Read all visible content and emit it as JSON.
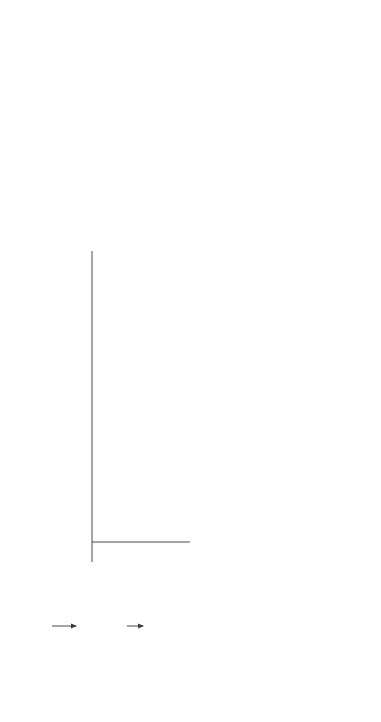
{
  "diagram": {
    "type": "flowchart",
    "orientation": "rotated-90-counterclockwise",
    "nodes": {
      "need": {
        "lines": [
          "Need"
        ]
      },
      "system_operational": {
        "lines": [
          "System operational",
          "requirements and",
          "maintenance concept",
          "(quality function deployment)"
        ]
      },
      "functional_analysis": {
        "sections": [
          {
            "lines": [
              "Functional analysis"
            ]
          },
          {
            "lines": [
              "Functional flow",
              "block diagrams"
            ]
          },
          {
            "lines": [
              "Allocation of system",
              "requirements"
            ]
          },
          {
            "lines": [
              "Preliminary",
              "analysis"
            ]
          }
        ]
      },
      "fmeca": {
        "lines": [
          "Failure mode,",
          "effects, and",
          "criticality",
          "analysis"
        ]
      },
      "maintainability": {
        "sections": [
          {
            "lines": [
              "Maintainability",
              "analysis"
            ]
          },
          {
            "lines": [
              "Level of repair"
            ]
          },
          {
            "lines": [
              "Maintainability",
              "prediction"
            ]
          }
        ]
      },
      "rcm": {
        "lines": [
          "Reliability-",
          "centered",
          "maintenance"
        ]
      },
      "maintenance_task": {
        "lines": [
          "Maintenance",
          "task",
          "analysis"
        ]
      },
      "life_cycle_cost": {
        "lines": [
          "Life-cycle",
          "cost analysis"
        ]
      },
      "decision": {
        "lines": [
          "Have the",
          "system",
          "requirements",
          "been met?"
        ]
      },
      "design_review": {
        "lines": [
          "Design review",
          "and evaluation"
        ]
      },
      "detailed_maintenance_plan": {
        "lines": [
          "Detailed",
          "maintenance",
          "plan"
        ]
      },
      "system_test": {
        "lines": [
          "System test",
          "and",
          "evaluation"
        ]
      },
      "reliability_prediction": {
        "lines": [
          "Reliability",
          "prediction"
        ]
      },
      "system_reliability": {
        "lines": [
          "System reliability",
          "analysis, modeling,",
          "and allocation"
        ]
      },
      "system_redesign": {
        "lines": [
          "System redesign"
        ]
      }
    },
    "edge_labels": {
      "yes": "Yes",
      "no": "No",
      "continuation_symbol": "~"
    },
    "edges": [
      [
        "need",
        "system_operational"
      ],
      [
        "system_operational",
        "functional_analysis"
      ],
      [
        "system_operational",
        "fmeca"
      ],
      [
        "system_operational",
        "maintainability"
      ],
      [
        "system_operational",
        "maintenance_task"
      ],
      [
        "system_operational",
        "life_cycle_cost"
      ],
      [
        "system_operational",
        "design_review"
      ],
      [
        "functional_analysis",
        "fmeca"
      ],
      [
        "functional_analysis",
        "system_reliability"
      ],
      [
        "fmeca",
        "maintainability"
      ],
      [
        "fmeca",
        "rcm"
      ],
      [
        "maintainability",
        "rcm"
      ],
      [
        "rcm",
        "maintenance_task"
      ],
      [
        "maintenance_task",
        "life_cycle_cost"
      ],
      [
        "life_cycle_cost",
        "decision"
      ],
      [
        "design_review",
        "decision"
      ],
      [
        "decision",
        "detailed_maintenance_plan",
        "Yes"
      ],
      [
        "decision",
        "system_redesign",
        "No"
      ],
      [
        "detailed_maintenance_plan",
        "system_test"
      ],
      [
        "system_reliability",
        "reliability_prediction"
      ],
      [
        "reliability_prediction",
        "fmeca"
      ],
      [
        "reliability_prediction",
        "rcm"
      ],
      [
        "reliability_prediction",
        "maintenance_task"
      ],
      [
        "reliability_prediction",
        "life_cycle_cost"
      ]
    ]
  }
}
